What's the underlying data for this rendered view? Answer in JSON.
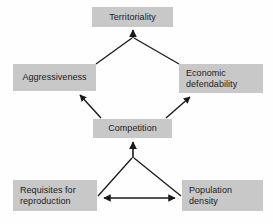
{
  "diagram": {
    "background_color": "#fefefe",
    "node_fill_color": "#c8c8c8",
    "edge_color": "#1a1a1a",
    "text_color": "#1b1b1b",
    "nodes": [
      {
        "id": "territoriality",
        "label": "Territoriality",
        "lines": [
          "Territoriality"
        ],
        "align": "center"
      },
      {
        "id": "aggressiveness",
        "label": "Aggressiveness",
        "lines": [
          "Aggressiveness"
        ],
        "align": "center"
      },
      {
        "id": "economic",
        "label": "Economic defendability",
        "lines": [
          "Economic",
          "defendability"
        ],
        "align": "left"
      },
      {
        "id": "competition",
        "label": "Competition",
        "lines": [
          "Competition"
        ],
        "align": "center"
      },
      {
        "id": "requisites",
        "label": "Requisites for reproduction",
        "lines": [
          "Requisites for",
          "reproduction"
        ],
        "align": "left"
      },
      {
        "id": "population",
        "label": "Population density",
        "lines": [
          "Population",
          "density"
        ],
        "align": "left"
      }
    ],
    "edges": [
      {
        "from": "aggressiveness",
        "to": "territoriality",
        "arrowheads": 1,
        "style": "converging"
      },
      {
        "from": "economic",
        "to": "territoriality",
        "arrowheads": 1,
        "style": "converging"
      },
      {
        "from": "competition",
        "to": "aggressiveness",
        "arrowheads": 1,
        "style": "straight"
      },
      {
        "from": "competition",
        "to": "economic",
        "arrowheads": 1,
        "style": "straight"
      },
      {
        "from": "requisites",
        "to": "competition",
        "arrowheads": 1,
        "style": "converging"
      },
      {
        "from": "population",
        "to": "competition",
        "arrowheads": 1,
        "style": "converging"
      },
      {
        "from": "requisites",
        "to": "population",
        "arrowheads": 2,
        "style": "double"
      }
    ]
  }
}
